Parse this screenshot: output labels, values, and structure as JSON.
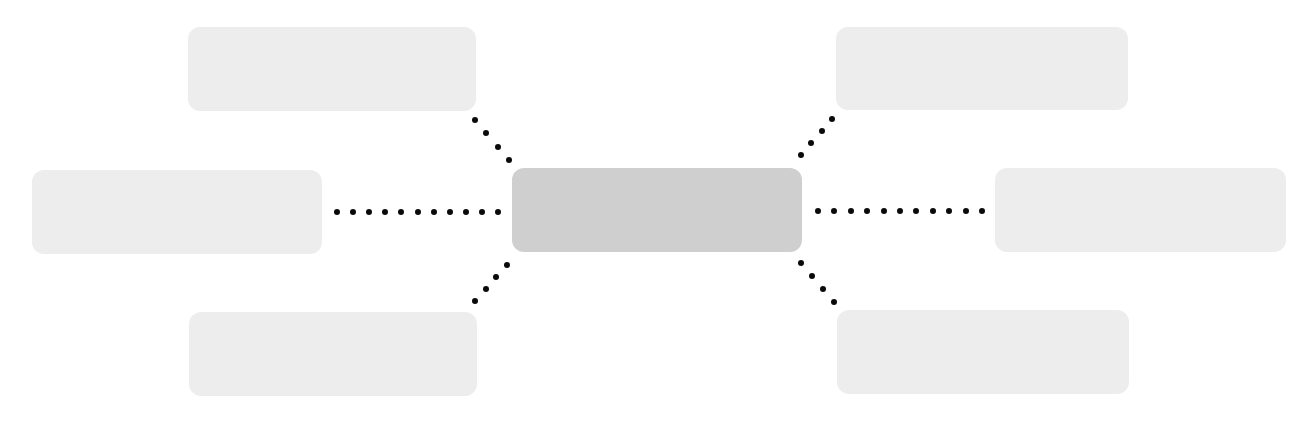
{
  "diagram": {
    "type": "hub-and-spoke",
    "colors": {
      "background": "#ffffff",
      "outer_box": "#ededed",
      "center_box": "#cfcfcf",
      "connector_dots": "#0a0a0a"
    },
    "center": {
      "label": "",
      "x": 512,
      "y": 168,
      "w": 290,
      "h": 84
    },
    "outer_nodes": [
      {
        "id": "top-left",
        "label": "",
        "x": 188,
        "y": 27,
        "w": 288,
        "h": 84
      },
      {
        "id": "left",
        "label": "",
        "x": 32,
        "y": 170,
        "w": 290,
        "h": 84
      },
      {
        "id": "bottom-left",
        "label": "",
        "x": 189,
        "y": 312,
        "w": 288,
        "h": 84
      },
      {
        "id": "top-right",
        "label": "",
        "x": 836,
        "y": 27,
        "w": 292,
        "h": 83
      },
      {
        "id": "right",
        "label": "",
        "x": 995,
        "y": 168,
        "w": 291,
        "h": 84
      },
      {
        "id": "bottom-right",
        "label": "",
        "x": 837,
        "y": 310,
        "w": 292,
        "h": 84
      }
    ],
    "connectors": [
      {
        "id": "to-top-left",
        "from": [
          509,
          160
        ],
        "to": [
          475,
          120
        ],
        "dots": 4
      },
      {
        "id": "to-left",
        "from": [
          498,
          212
        ],
        "to": [
          337,
          212
        ],
        "dots": 11
      },
      {
        "id": "to-bottom-left",
        "from": [
          507,
          265
        ],
        "to": [
          475,
          301
        ],
        "dots": 4
      },
      {
        "id": "to-top-right",
        "from": [
          801,
          155
        ],
        "to": [
          832,
          119
        ],
        "dots": 4
      },
      {
        "id": "to-right",
        "from": [
          818,
          211
        ],
        "to": [
          982,
          211
        ],
        "dots": 11
      },
      {
        "id": "to-bottom-right",
        "from": [
          801,
          263
        ],
        "to": [
          834,
          302
        ],
        "dots": 4
      }
    ]
  }
}
